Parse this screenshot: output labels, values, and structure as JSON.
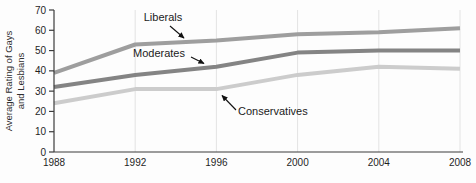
{
  "chart_data": {
    "type": "line",
    "x": [
      1988,
      1992,
      1996,
      2000,
      2004,
      2008
    ],
    "xlim": [
      1988,
      2008
    ],
    "ylim": [
      0,
      70
    ],
    "yticks": [
      0,
      10,
      20,
      30,
      40,
      50,
      60,
      70
    ],
    "xticks": [
      1988,
      1992,
      1996,
      2000,
      2004,
      2008
    ],
    "title": "",
    "xlabel": "",
    "ylabel": "Average Rating of Gays and Lesbians",
    "ylabel_lines": [
      "Average Rating of Gays",
      "and Lesbians"
    ],
    "grid": "vertical-only",
    "legend_position": "inline-annotations-with-arrows",
    "series": [
      {
        "name": "Liberals",
        "color": "#9e9e9e",
        "values": [
          39,
          53,
          55,
          58,
          59,
          61
        ]
      },
      {
        "name": "Moderates",
        "color": "#848484",
        "values": [
          32,
          38,
          42,
          49,
          50,
          50
        ]
      },
      {
        "name": "Conservatives",
        "color": "#cccccc",
        "values": [
          24,
          31,
          31,
          38,
          42,
          41
        ]
      }
    ],
    "colors": {
      "grid": "#e3e3e3",
      "axis": "#3c3c3c",
      "arrow": "#111111",
      "background": "#fdfdfd"
    }
  }
}
